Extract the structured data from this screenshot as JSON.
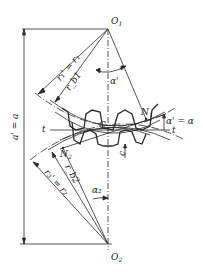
{
  "diagram": {
    "points": {
      "O1": {
        "label": "O",
        "sub": "1",
        "x": 108,
        "y": 29
      },
      "O2": {
        "label": "O",
        "sub": "2",
        "x": 108,
        "y": 244
      },
      "C": {
        "label": "C",
        "x": 108,
        "y": 125
      },
      "N1": {
        "label": "N",
        "sub": "1",
        "x": 146,
        "y": 119
      },
      "N2": {
        "label": "N",
        "sub": "2",
        "x": 63,
        "y": 148
      }
    },
    "labels": {
      "center_distance": "a' = a",
      "r1_pitch": "r₁' = r₁",
      "rb1": "r_b1",
      "r2_pitch": "r₂' = r₂",
      "rb2": "r_b2",
      "alpha_prime": "α'",
      "alpha_eq": "α' = α",
      "alpha2": "α₂",
      "t_left": "t",
      "t_right": "t",
      "clearance": "c"
    },
    "colors": {
      "line": "#2a2a2a",
      "background": "#ffffff"
    }
  }
}
